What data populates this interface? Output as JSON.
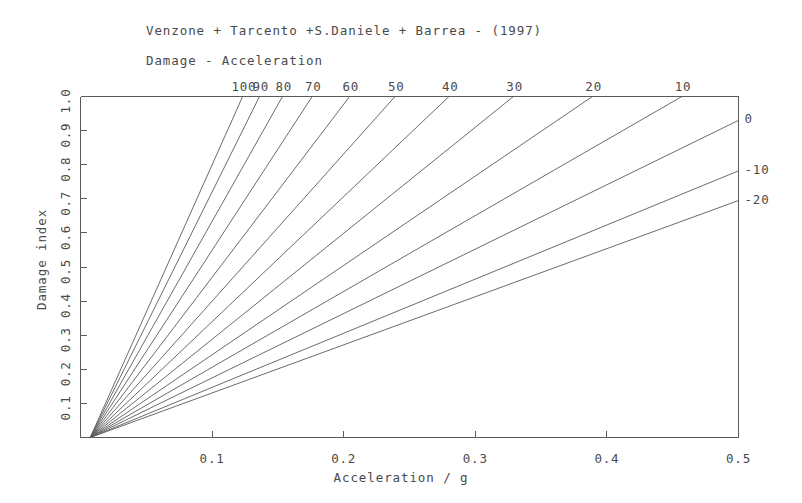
{
  "header": {
    "title": "Venzone + Tarcento +S.Daniele + Barrea - (1997)",
    "subtitle": "Damage - Acceleration"
  },
  "chart_data": {
    "type": "line",
    "title": "Venzone + Tarcento +S.Daniele + Barrea - (1997)",
    "subtitle": "Damage - Acceleration",
    "xlabel": "Acceleration / g",
    "ylabel": "Damage index",
    "xlim": [
      0.0,
      0.5
    ],
    "ylim": [
      0.0,
      1.0
    ],
    "grid": false,
    "legend_position": "top-and-right-edge-annotations",
    "xticks": [
      {
        "value": 0.1,
        "label": "0.1"
      },
      {
        "value": 0.2,
        "label": "0.2"
      },
      {
        "value": 0.3,
        "label": "0.3"
      },
      {
        "value": 0.4,
        "label": "0.4"
      },
      {
        "value": 0.5,
        "label": "0.5"
      }
    ],
    "yticks": [
      {
        "value": 0.1,
        "label": "0.1"
      },
      {
        "value": 0.2,
        "label": "0.2"
      },
      {
        "value": 0.3,
        "label": "0.3"
      },
      {
        "value": 0.4,
        "label": "0.4"
      },
      {
        "value": 0.5,
        "label": "0.5"
      },
      {
        "value": 0.6,
        "label": "0.6"
      },
      {
        "value": 0.7,
        "label": "0.7"
      },
      {
        "value": 0.8,
        "label": "0.8"
      },
      {
        "value": 0.9,
        "label": "0.9"
      },
      {
        "value": 1.0,
        "label": "1.0"
      }
    ],
    "origin": {
      "x": 0.0074,
      "y": 0.0
    },
    "series": [
      {
        "name": "100",
        "label": "100",
        "label_edge": "top",
        "exit_x": 0.1232,
        "exit_y": 1.0
      },
      {
        "name": "90",
        "label": "90",
        "label_edge": "top",
        "exit_x": 0.136,
        "exit_y": 1.0
      },
      {
        "name": "80",
        "label": "80",
        "label_edge": "top",
        "exit_x": 0.1535,
        "exit_y": 1.0
      },
      {
        "name": "70",
        "label": "70",
        "label_edge": "top",
        "exit_x": 0.176,
        "exit_y": 1.0
      },
      {
        "name": "60",
        "label": "60",
        "label_edge": "top",
        "exit_x": 0.2045,
        "exit_y": 1.0
      },
      {
        "name": "50",
        "label": "50",
        "label_edge": "top",
        "exit_x": 0.239,
        "exit_y": 1.0
      },
      {
        "name": "40",
        "label": "40",
        "label_edge": "top",
        "exit_x": 0.28,
        "exit_y": 1.0
      },
      {
        "name": "30",
        "label": "30",
        "label_edge": "top",
        "exit_x": 0.329,
        "exit_y": 1.0
      },
      {
        "name": "20",
        "label": "20",
        "label_edge": "top",
        "exit_x": 0.389,
        "exit_y": 1.0
      },
      {
        "name": "10",
        "label": "10",
        "label_edge": "top",
        "exit_x": 0.457,
        "exit_y": 1.0
      },
      {
        "name": "0",
        "label": "0",
        "label_edge": "right",
        "exit_x": 0.5,
        "exit_y": 0.93
      },
      {
        "name": "-10",
        "label": "-10",
        "label_edge": "right",
        "exit_x": 0.5,
        "exit_y": 0.782
      },
      {
        "name": "-20",
        "label": "-20",
        "label_edge": "right",
        "exit_x": 0.5,
        "exit_y": 0.695
      }
    ]
  },
  "icons": {
    "plot-frame": "plot-frame"
  }
}
